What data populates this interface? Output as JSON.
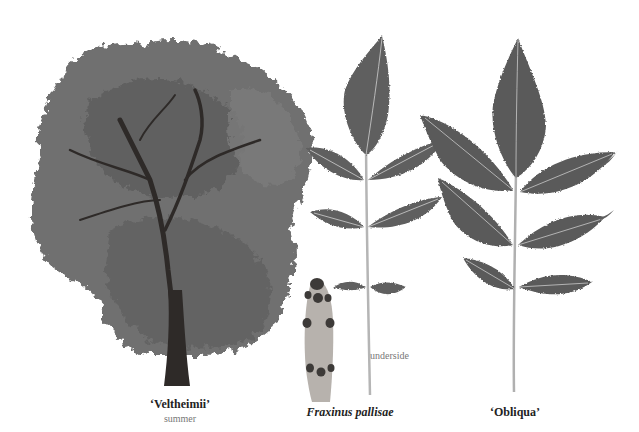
{
  "plate": {
    "specimens": [
      {
        "id": "veltheimii",
        "name": "‘Veltheimii’",
        "caption": "summer",
        "subject": "tree"
      },
      {
        "id": "pallisae",
        "name": "Fraxinus pallisae",
        "annotation": "underside",
        "subject": "leaf-and-twig"
      },
      {
        "id": "obliqua",
        "name": "‘Obliqua’",
        "subject": "leaf"
      }
    ],
    "colors": {
      "foliage": "#6b6b6b",
      "foliage_dark": "#4a4a4a",
      "trunk": "#2e2a28",
      "leaf": "#5e5e5e",
      "vein": "#c9c9c9",
      "twig": "#b7b2ad",
      "bud": "#3d3a38",
      "background": "#ffffff"
    }
  }
}
